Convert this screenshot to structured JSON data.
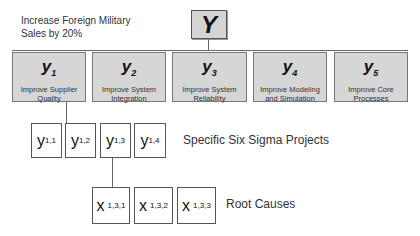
{
  "goal": {
    "line1": "Increase Foreign Military",
    "line2": "Sales by 20%"
  },
  "top": {
    "symbol": "Y"
  },
  "level1": [
    {
      "symbol": "y",
      "sub": "1",
      "line1": "Improve Supplier",
      "line2": "Quality"
    },
    {
      "symbol": "y",
      "sub": "2",
      "line1": "Improve System",
      "line2": "Integration"
    },
    {
      "symbol": "y",
      "sub": "3",
      "line1": "Improve System",
      "line2": "Reliability"
    },
    {
      "symbol": "y",
      "sub": "4",
      "line1": "Improve Modeling",
      "line2": "and Simulation"
    },
    {
      "symbol": "y",
      "sub": "5",
      "line1": "Improve Core",
      "line2": "Processes"
    }
  ],
  "level2": {
    "caption": "Specific Six Sigma Projects",
    "items": [
      {
        "symbol": "y",
        "sub": "1,1"
      },
      {
        "symbol": "y",
        "sub": "1,2"
      },
      {
        "symbol": "y",
        "sub": "1,3"
      },
      {
        "symbol": "y",
        "sub": "1,4"
      }
    ]
  },
  "level3": {
    "caption": "Root Causes",
    "items": [
      {
        "symbol": "x",
        "sub": "1,3,1"
      },
      {
        "symbol": "x",
        "sub": "1,3,2"
      },
      {
        "symbol": "x",
        "sub": "1,3,3"
      }
    ]
  },
  "colors": {
    "box_fill": "#d6d6d6",
    "border": "#555555",
    "line": "#666666"
  }
}
